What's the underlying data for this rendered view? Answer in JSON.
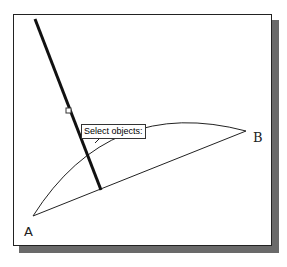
{
  "tooltip": {
    "text": "Select objects:"
  },
  "points": {
    "a": {
      "label": "A",
      "x": 33,
      "y": 216
    },
    "b": {
      "label": "B",
      "x": 246,
      "y": 131
    }
  },
  "colors": {
    "stroke": "#1a1a1a",
    "shadow": "#6a6a6a",
    "background": "#ffffff"
  }
}
